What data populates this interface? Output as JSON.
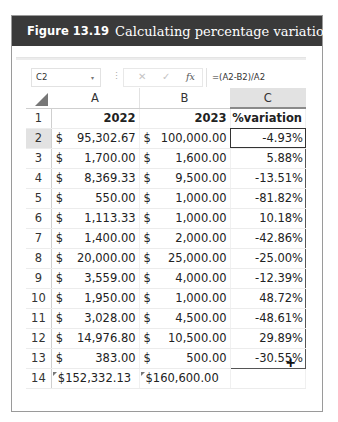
{
  "figure": {
    "label": "Figure 13.19",
    "title": "Calculating percentage variations"
  },
  "formula_bar": {
    "name_box": "C2",
    "name_box_arrow": "▾",
    "separator": "⋮",
    "cancel_icon": "✕",
    "enter_icon": "✓",
    "fx_icon": "fx",
    "formula": "=(A2-B2)/A2"
  },
  "columns": [
    "A",
    "B",
    "C"
  ],
  "header_row": {
    "row": "1",
    "a": "2022",
    "b": "2023",
    "c": "%variation"
  },
  "rows": [
    {
      "row": "2",
      "a_sym": "$",
      "a": "95,302.67",
      "b_sym": "$",
      "b": "100,000.00",
      "c": "-4.93%"
    },
    {
      "row": "3",
      "a_sym": "$",
      "a": "1,700.00",
      "b_sym": "$",
      "b": "1,600.00",
      "c": "5.88%"
    },
    {
      "row": "4",
      "a_sym": "$",
      "a": "8,369.33",
      "b_sym": "$",
      "b": "9,500.00",
      "c": "-13.51%"
    },
    {
      "row": "5",
      "a_sym": "$",
      "a": "550.00",
      "b_sym": "$",
      "b": "1,000.00",
      "c": "-81.82%"
    },
    {
      "row": "6",
      "a_sym": "$",
      "a": "1,113.33",
      "b_sym": "$",
      "b": "1,000.00",
      "c": "10.18%"
    },
    {
      "row": "7",
      "a_sym": "$",
      "a": "1,400.00",
      "b_sym": "$",
      "b": "2,000.00",
      "c": "-42.86%"
    },
    {
      "row": "8",
      "a_sym": "$",
      "a": "20,000.00",
      "b_sym": "$",
      "b": "25,000.00",
      "c": "-25.00%"
    },
    {
      "row": "9",
      "a_sym": "$",
      "a": "3,559.00",
      "b_sym": "$",
      "b": "4,000.00",
      "c": "-12.39%"
    },
    {
      "row": "10",
      "a_sym": "$",
      "a": "1,950.00",
      "b_sym": "$",
      "b": "1,000.00",
      "c": "48.72%"
    },
    {
      "row": "11",
      "a_sym": "$",
      "a": "3,028.00",
      "b_sym": "$",
      "b": "4,500.00",
      "c": "-48.61%"
    },
    {
      "row": "12",
      "a_sym": "$",
      "a": "14,976.80",
      "b_sym": "$",
      "b": "10,500.00",
      "c": "29.89%"
    },
    {
      "row": "13",
      "a_sym": "$",
      "a": "383.00",
      "b_sym": "$",
      "b": "500.00",
      "c": "-30.55%"
    }
  ],
  "total_row": {
    "row": "14",
    "a": "$152,332.13",
    "b": "$160,600.00",
    "c": ""
  },
  "fill_handle": "+"
}
